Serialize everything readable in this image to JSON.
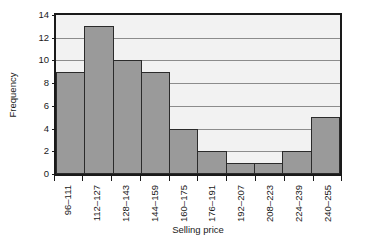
{
  "chart_data": {
    "type": "bar",
    "title": "",
    "subtitle": "",
    "xlabel": "Selling price",
    "ylabel": "Frequency",
    "categories": [
      "96–111",
      "112–127",
      "128–143",
      "144–159",
      "160–175",
      "176–191",
      "192–207",
      "208–223",
      "224–239",
      "240–255"
    ],
    "values": [
      9,
      13,
      10,
      9,
      4,
      2,
      1,
      1,
      2,
      5
    ],
    "ylim": [
      0,
      14
    ],
    "ytick_step": 2,
    "yticks": [
      "0",
      "2",
      "4",
      "6",
      "8",
      "10",
      "12",
      "14"
    ],
    "ytick_values": [
      0,
      2,
      4,
      6,
      8,
      10,
      12,
      14
    ],
    "grid": "horizontal",
    "legend": "none",
    "bar_style": "contiguous-histogram",
    "annotations": []
  },
  "style": {
    "bar_fill": "#9a9a9a",
    "bar_border": "#2b2b2b",
    "plot_background": "#f2f2f2",
    "page_background": "#ffffff",
    "gridline_color": "#8c8c8c",
    "axis_color": "#1a1a1a",
    "text_color": "#1a1a1a"
  }
}
